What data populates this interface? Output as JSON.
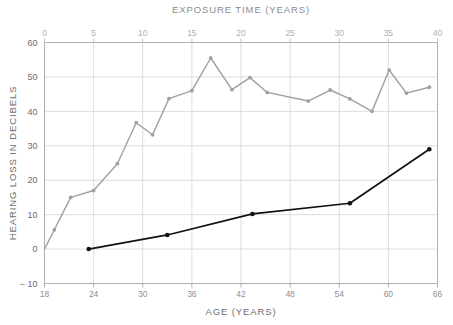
{
  "chart_data": {
    "type": "line",
    "title": "",
    "top_axis": {
      "label": "EXPOSURE TIME (YEARS)",
      "ticks": [
        0,
        5,
        10,
        15,
        20,
        25,
        30,
        35,
        40
      ],
      "range": [
        0,
        40
      ]
    },
    "xlabel": "AGE (YEARS)",
    "xticks": [
      18,
      24,
      30,
      36,
      42,
      48,
      54,
      60,
      66
    ],
    "xlim": [
      18,
      66
    ],
    "ylabel": "HEARING LOSS IN DECIBELS",
    "yticks": [
      -10,
      0,
      10,
      20,
      30,
      40,
      50,
      60
    ],
    "ylim": [
      -10,
      60
    ],
    "grid": true,
    "legend": "none",
    "series": [
      {
        "name": "exposed-group",
        "color": "#a0a0a0",
        "marker": "circle",
        "points": [
          {
            "x": 18.0,
            "y": 0.0
          },
          {
            "x": 19.2,
            "y": 5.6
          },
          {
            "x": 21.2,
            "y": 15.0
          },
          {
            "x": 24.0,
            "y": 17.0
          },
          {
            "x": 26.9,
            "y": 24.8
          },
          {
            "x": 29.2,
            "y": 36.7
          },
          {
            "x": 31.2,
            "y": 33.2
          },
          {
            "x": 33.2,
            "y": 43.7
          },
          {
            "x": 36.0,
            "y": 46.0
          },
          {
            "x": 38.3,
            "y": 55.5
          },
          {
            "x": 40.9,
            "y": 46.3
          },
          {
            "x": 43.1,
            "y": 49.8
          },
          {
            "x": 45.2,
            "y": 45.5
          },
          {
            "x": 50.2,
            "y": 43.0
          },
          {
            "x": 52.9,
            "y": 46.2
          },
          {
            "x": 55.3,
            "y": 43.6
          },
          {
            "x": 58.0,
            "y": 40.0
          },
          {
            "x": 60.1,
            "y": 52.0
          },
          {
            "x": 62.2,
            "y": 45.3
          },
          {
            "x": 65.0,
            "y": 47.0
          }
        ]
      },
      {
        "name": "control-group",
        "color": "#111111",
        "marker": "circle",
        "points": [
          {
            "x": 23.4,
            "y": 0.0
          },
          {
            "x": 33.0,
            "y": 4.1
          },
          {
            "x": 43.4,
            "y": 10.2
          },
          {
            "x": 55.3,
            "y": 13.3
          },
          {
            "x": 65.0,
            "y": 29.0
          }
        ]
      }
    ]
  }
}
